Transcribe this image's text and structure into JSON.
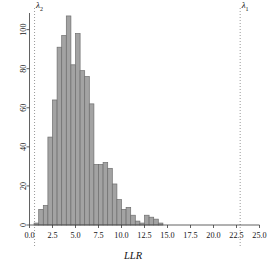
{
  "chart_data": {
    "type": "bar",
    "title": "",
    "subtitle": "",
    "xlabel": "LLR",
    "ylabel": "",
    "xlim": [
      0.0,
      25.0
    ],
    "ylim": [
      0,
      108
    ],
    "grid": false,
    "legend": null,
    "bin_width": 0.5,
    "bar_fill_color": "#a3a3a3",
    "bar_edge_color": "#6e6e6e",
    "xticks": [
      "0.0",
      "2.5",
      "5.0",
      "7.5",
      "10.0",
      "12.5",
      "15.0",
      "17.5",
      "20.0",
      "22.5",
      "25.0"
    ],
    "xtick_values": [
      0.0,
      2.5,
      5.0,
      7.5,
      10.0,
      12.5,
      15.0,
      17.5,
      20.0,
      22.5,
      25.0
    ],
    "yticks": [
      "0",
      "20",
      "40",
      "60",
      "80",
      "100"
    ],
    "ytick_values": [
      0,
      20,
      40,
      60,
      80,
      100
    ],
    "bin_left_edges": [
      0.5,
      1.0,
      1.5,
      2.0,
      2.5,
      3.0,
      3.5,
      4.0,
      4.5,
      5.0,
      5.5,
      6.0,
      6.5,
      7.0,
      7.5,
      8.0,
      8.5,
      9.0,
      9.5,
      10.0,
      10.5,
      11.0,
      11.5,
      12.0,
      12.5,
      13.0,
      13.5,
      14.0,
      14.5
    ],
    "values": [
      1,
      8,
      10,
      45,
      64,
      91,
      97,
      107,
      82,
      98,
      79,
      76,
      62,
      31,
      31,
      32,
      29,
      21,
      13,
      8,
      9,
      5,
      2,
      1,
      5,
      4,
      3,
      1,
      0
    ],
    "annotations": [
      {
        "name": "lambda-2",
        "label": "λ",
        "subscript": "2",
        "x": 0.55,
        "style": "dotted-vertical-line"
      },
      {
        "name": "lambda-1",
        "label": "λ",
        "subscript": "1",
        "x": 22.9,
        "style": "dotted-vertical-line"
      }
    ]
  },
  "figure": {
    "axis_title_x": "LLR",
    "lambda2_label": "λ",
    "lambda2_sub": "2",
    "lambda1_label": "λ",
    "lambda1_sub": "1"
  }
}
